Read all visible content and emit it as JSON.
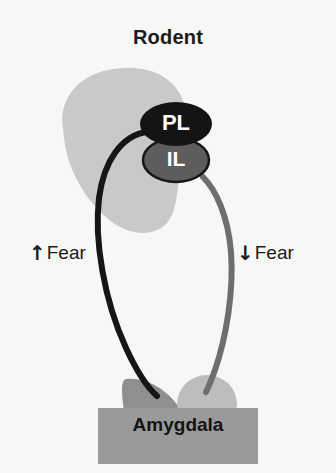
{
  "figure": {
    "title": "Rodent",
    "background_color": "#f7f7f5"
  },
  "regions": {
    "cortex_blob": {
      "name": "medial prefrontal cortex",
      "color": "#c9c9c9"
    },
    "pl": {
      "label": "PL",
      "fill_color": "#141414",
      "text_color": "#ffffff"
    },
    "il": {
      "label": "IL",
      "fill_color": "#5d5d5d",
      "outline_color": "#161616",
      "text_color": "#ffffff"
    },
    "amygdala": {
      "label": "Amygdala",
      "band_color": "#9a9a9a",
      "crescent_color": "#8f8f8f",
      "circle_color": "#bdbdbd",
      "text_color": "#141414"
    }
  },
  "projections": [
    {
      "source": "PL",
      "target": "Amygdala",
      "effect_label": "Fear",
      "arrow": "up",
      "arrow_glyph": "↑",
      "color": "#161616",
      "side": "left"
    },
    {
      "source": "IL",
      "target": "Amygdala",
      "effect_label": "Fear",
      "arrow": "down",
      "arrow_glyph": "↓",
      "color": "#6e6e6e",
      "side": "right"
    }
  ]
}
